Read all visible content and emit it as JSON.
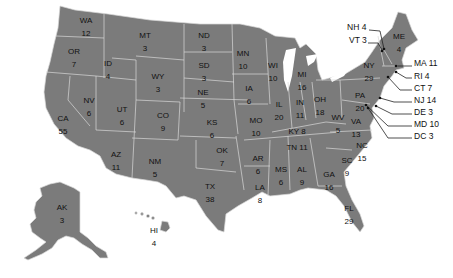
{
  "map": {
    "title": "US Electoral Votes by State",
    "fill_color": "#7b7b7b",
    "border_color": "#d8d8d8",
    "label_color": "#111111",
    "states": [
      {
        "abbr": "WA",
        "votes": "12",
        "x": 86,
        "y": 16
      },
      {
        "abbr": "OR",
        "votes": "7",
        "x": 74,
        "y": 47
      },
      {
        "abbr": "ID",
        "votes": "4",
        "x": 108,
        "y": 59
      },
      {
        "abbr": "MT",
        "votes": "3",
        "x": 145,
        "y": 31
      },
      {
        "abbr": "WY",
        "votes": "3",
        "x": 158,
        "y": 72
      },
      {
        "abbr": "ND",
        "votes": "3",
        "x": 204,
        "y": 31
      },
      {
        "abbr": "SD",
        "votes": "3",
        "x": 204,
        "y": 61
      },
      {
        "abbr": "NE",
        "votes": "5",
        "x": 203,
        "y": 88
      },
      {
        "abbr": "MN",
        "votes": "10",
        "x": 243,
        "y": 49
      },
      {
        "abbr": "WI",
        "votes": "10",
        "x": 273,
        "y": 61
      },
      {
        "abbr": "IA",
        "votes": "6",
        "x": 249,
        "y": 84
      },
      {
        "abbr": "IL",
        "votes": "20",
        "x": 279,
        "y": 100
      },
      {
        "abbr": "MI",
        "votes": "16",
        "x": 302,
        "y": 70
      },
      {
        "abbr": "IN",
        "votes": "11",
        "x": 300,
        "y": 98
      },
      {
        "abbr": "OH",
        "votes": "18",
        "x": 320,
        "y": 95
      },
      {
        "abbr": "NV",
        "votes": "6",
        "x": 89,
        "y": 96
      },
      {
        "abbr": "UT",
        "votes": "6",
        "x": 122,
        "y": 105
      },
      {
        "abbr": "CO",
        "votes": "9",
        "x": 163,
        "y": 111
      },
      {
        "abbr": "KS",
        "votes": "6",
        "x": 212,
        "y": 118
      },
      {
        "abbr": "MO",
        "votes": "10",
        "x": 256,
        "y": 116
      },
      {
        "abbr": "CA",
        "votes": "55",
        "x": 63,
        "y": 114
      },
      {
        "abbr": "AZ",
        "votes": "11",
        "x": 116,
        "y": 150
      },
      {
        "abbr": "NM",
        "votes": "5",
        "x": 155,
        "y": 157
      },
      {
        "abbr": "OK",
        "votes": "7",
        "x": 222,
        "y": 146
      },
      {
        "abbr": "AR",
        "votes": "6",
        "x": 258,
        "y": 154
      },
      {
        "abbr": "TX",
        "votes": "38",
        "x": 210,
        "y": 182
      },
      {
        "abbr": "LA",
        "votes": "8",
        "x": 260,
        "y": 183
      },
      {
        "abbr": "MS",
        "votes": "6",
        "x": 281,
        "y": 165
      },
      {
        "abbr": "AL",
        "votes": "9",
        "x": 302,
        "y": 165
      },
      {
        "abbr": "GA",
        "votes": "16",
        "x": 329,
        "y": 170
      },
      {
        "abbr": "SC",
        "votes": "9",
        "x": 347,
        "y": 156
      },
      {
        "abbr": "FL",
        "votes": "29",
        "x": 349,
        "y": 204
      },
      {
        "abbr": "AK",
        "votes": "3",
        "x": 62,
        "y": 203
      },
      {
        "abbr": "HI",
        "votes": "4",
        "x": 154,
        "y": 226
      },
      {
        "abbr": "PA",
        "votes": "20",
        "x": 360,
        "y": 91
      },
      {
        "abbr": "NY",
        "votes": "29",
        "x": 369,
        "y": 61
      },
      {
        "abbr": "ME",
        "votes": "4",
        "x": 399,
        "y": 32
      },
      {
        "abbr": "WV",
        "votes": "5",
        "x": 338,
        "y": 113
      },
      {
        "abbr": "VA",
        "votes": "13",
        "x": 356,
        "y": 117
      },
      {
        "abbr": "NC",
        "votes": "15",
        "x": 362,
        "y": 141
      }
    ],
    "inline_labels": [
      {
        "text": "KY 8",
        "x": 297,
        "y": 127
      },
      {
        "text": "TN 11",
        "x": 297,
        "y": 143
      }
    ],
    "callouts": [
      {
        "text": "NH 4",
        "x": 347,
        "y": 27
      },
      {
        "text": "VT 3",
        "x": 349,
        "y": 40
      },
      {
        "text": "MA 11",
        "x": 414,
        "y": 63
      },
      {
        "text": "RI 4",
        "x": 414,
        "y": 76
      },
      {
        "text": "CT 7",
        "x": 414,
        "y": 88
      },
      {
        "text": "NJ 14",
        "x": 414,
        "y": 100
      },
      {
        "text": "DE 3",
        "x": 414,
        "y": 112
      },
      {
        "text": "MD 10",
        "x": 414,
        "y": 124
      },
      {
        "text": "DC 3",
        "x": 414,
        "y": 136
      }
    ]
  }
}
